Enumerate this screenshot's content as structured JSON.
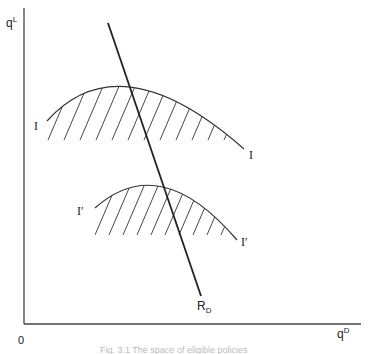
{
  "diagram": {
    "axes": {
      "y_label": "q",
      "y_label_sup": "L",
      "x_label": "q",
      "x_label_sup": "D",
      "origin_label": "0"
    },
    "curves": {
      "upper": {
        "label_left": "I",
        "label_right": "I"
      },
      "lower": {
        "label_left": "I′",
        "label_right": "I′"
      }
    },
    "line": {
      "label": "R",
      "label_sub": "D"
    },
    "caption": "Fig. 3.1   The space of eligible policies"
  }
}
